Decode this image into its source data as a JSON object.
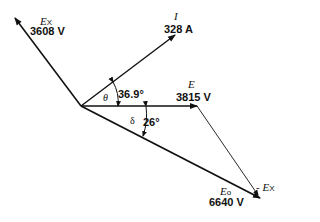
{
  "diagram": {
    "type": "phasor-diagram",
    "origin": [
      81,
      106
    ],
    "colors": {
      "stroke": "#111111",
      "background": "#ffffff"
    },
    "vectors": [
      {
        "id": "Ex",
        "symbol": "E",
        "subscript": "X",
        "value": "3608 V",
        "tip": [
          15,
          18
        ]
      },
      {
        "id": "I",
        "symbol": "I",
        "subscript": "",
        "value": "328 A",
        "tip": [
          175,
          35
        ]
      },
      {
        "id": "E",
        "symbol": "E",
        "subscript": "",
        "value": "3815 V",
        "tip": [
          197,
          106
        ]
      },
      {
        "id": "Eo",
        "symbol": "E",
        "subscript": "o",
        "value": "6640 V",
        "tip": [
          260,
          198
        ]
      },
      {
        "id": "neg-Ex",
        "symbol": "- E",
        "subscript": "X",
        "value": "",
        "from": [
          197,
          106
        ],
        "tip": [
          260,
          198
        ]
      }
    ],
    "angles": [
      {
        "symbol": "θ",
        "value": "36.9°",
        "between": [
          "E",
          "I"
        ]
      },
      {
        "symbol": "δ",
        "value": "26°",
        "between": [
          "E",
          "Eo"
        ]
      }
    ]
  }
}
